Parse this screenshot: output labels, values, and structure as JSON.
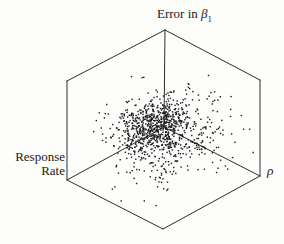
{
  "figure": {
    "background": "#fdfdfc",
    "labels": {
      "vertical_axis": {
        "prefix": "Error in ",
        "symbol": "β",
        "subscript": "1"
      },
      "left_axis": {
        "line1": "Response",
        "line2": "Rate"
      },
      "right_axis": "ρ"
    }
  },
  "chart_data": {
    "type": "scatter",
    "projection": "3d-box",
    "title": "",
    "axis_labels": {
      "vertical": "Error in β₁",
      "left": "Response Rate",
      "right": "ρ"
    },
    "tick_labels": [],
    "grid": false,
    "legend": false,
    "point_count": 1000,
    "point_color": "#1b1b1b",
    "point_size_px": 1.4,
    "frame_color": "#2e2c29",
    "frame_stroke_px": 1,
    "seed": 13,
    "distribution": {
      "space": "unit cube: u = rho axis, v = response-rate axis, w = error axis",
      "clip": [
        0.01,
        0.99
      ],
      "components": [
        {
          "weight": 0.6,
          "center": [
            0.46,
            0.56,
            0.52
          ],
          "sigma": [
            0.14,
            0.12,
            0.1
          ]
        },
        {
          "weight": 0.4,
          "center": [
            0.53,
            0.44,
            0.4
          ],
          "sigma": [
            0.28,
            0.24,
            0.2
          ]
        }
      ]
    },
    "frame_px": {
      "top_back": [
        165,
        30
      ],
      "left_top": [
        67,
        81
      ],
      "right_top": [
        260,
        80
      ],
      "left_bottom": [
        67,
        180
      ],
      "right_bottom": [
        260,
        176
      ],
      "front_bottom": [
        163,
        229
      ],
      "origin_back": [
        164,
        127
      ],
      "vertical_height": 97
    }
  }
}
